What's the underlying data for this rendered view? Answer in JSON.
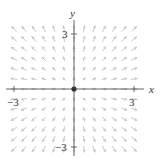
{
  "figure": {
    "type": "vector-field",
    "field": {
      "Fx": "x",
      "Fy": "y"
    },
    "x_axis_label": "x",
    "y_axis_label": "y",
    "x_ticks": [
      {
        "value": -3,
        "label": "−3"
      },
      {
        "value": 3,
        "label": "3"
      }
    ],
    "y_ticks": [
      {
        "value": 3,
        "label": "3"
      },
      {
        "value": -3,
        "label": "−3"
      }
    ],
    "x_range": [
      -3.5,
      3.5
    ],
    "y_range": [
      -3.5,
      3.5
    ],
    "grid_step": 0.5,
    "arrow_color": "#c8c8c8",
    "axis_color": "#555555",
    "origin_dot_color": "#333333"
  },
  "layout": {
    "origin_px": [
      74,
      89
    ],
    "unit_px": 20
  }
}
